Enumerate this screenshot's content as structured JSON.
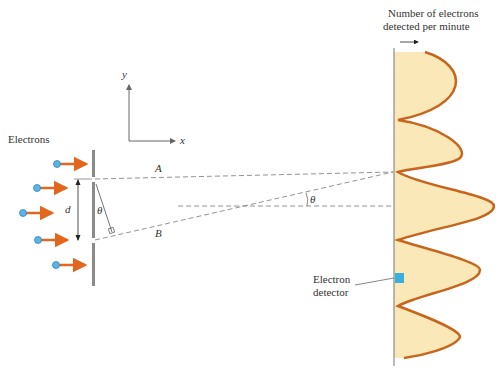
{
  "labels": {
    "electrons": "Electrons",
    "axis_y": "y",
    "axis_x": "x",
    "path_a": "A",
    "path_b": "B",
    "slit_separation": "d",
    "angle_at_slits": "θ",
    "angle_at_screen": "θ",
    "graph_title_line1": "Number of electrons",
    "graph_title_line2": "detected per minute",
    "detector_line1": "Electron",
    "detector_line2": "detector"
  },
  "colors": {
    "electron_arrow": "#e2661e",
    "electron_dot": "#5ab4e6",
    "fringe_curve": "#c8651c",
    "fringe_fill": "#fbe6b0",
    "detector": "#3aaee0",
    "barrier": "#8a8a8a",
    "dashed_line": "#777777"
  },
  "electrons": [
    {
      "x": 57,
      "y": 164
    },
    {
      "x": 37,
      "y": 188
    },
    {
      "x": 17,
      "y": 213
    },
    {
      "x": 37,
      "y": 238
    },
    {
      "x": 57,
      "y": 264
    }
  ]
}
